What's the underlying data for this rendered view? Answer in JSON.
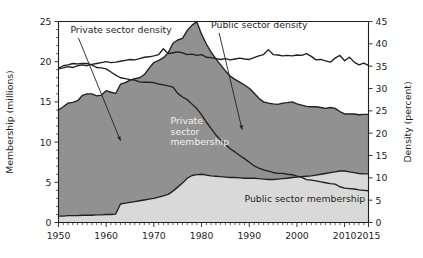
{
  "chart_data": {
    "type": "area",
    "title": "",
    "subtitle": "",
    "xlabel": "",
    "ylabel": "Membership (millions)",
    "y2label": "Density (percent)",
    "xlim": [
      1950,
      2015
    ],
    "ylim": [
      0,
      25
    ],
    "y2lim": [
      0,
      45
    ],
    "grid": false,
    "legend": "annotations-inline",
    "xticks": [
      1950,
      1960,
      1970,
      1980,
      1990,
      2000,
      2010,
      2015
    ],
    "xticklabels": [
      "1950",
      "1960",
      "1970",
      "1980",
      "1990",
      "2000",
      "2010",
      "2015"
    ],
    "yticks": [
      0,
      5,
      10,
      15,
      20,
      25
    ],
    "yticklabels": [
      "0",
      "5",
      "10",
      "15",
      "20",
      "25"
    ],
    "y2ticks": [
      0,
      5,
      10,
      15,
      20,
      25,
      30,
      35,
      40,
      45
    ],
    "y2ticklabels": [
      "0",
      "5",
      "10",
      "15",
      "20",
      "25",
      "30",
      "35",
      "40",
      "45"
    ],
    "annotations": [
      {
        "name": "private-sector-density-label",
        "text": "Private sector density",
        "x": 1952.5,
        "y": 23.6,
        "arrow_to_x": 1963.0,
        "arrow_to_y": 18.3
      },
      {
        "name": "public-sector-density-label",
        "text": "Public sector density",
        "x": 1982.0,
        "y": 24.2,
        "arrow_to_x": 1988.5,
        "arrow_to_y": 20.8
      },
      {
        "name": "private-sector-membership-label",
        "text": "Private\nsector\nmembership",
        "x": 1973.5,
        "y": 12.2
      },
      {
        "name": "public-sector-membership-label",
        "text": "Public sector membership",
        "x": 1989.0,
        "y": 2.6
      }
    ],
    "x": [
      1950,
      1951,
      1952,
      1953,
      1954,
      1955,
      1956,
      1957,
      1958,
      1959,
      1960,
      1961,
      1962,
      1963,
      1964,
      1965,
      1966,
      1967,
      1968,
      1969,
      1970,
      1971,
      1972,
      1973,
      1974,
      1975,
      1976,
      1977,
      1978,
      1979,
      1980,
      1981,
      1982,
      1983,
      1984,
      1985,
      1986,
      1987,
      1988,
      1989,
      1990,
      1991,
      1992,
      1993,
      1994,
      1995,
      1996,
      1997,
      1998,
      1999,
      2000,
      2001,
      2002,
      2003,
      2004,
      2005,
      2006,
      2007,
      2008,
      2009,
      2010,
      2011,
      2012,
      2013,
      2014,
      2015
    ],
    "series": [
      {
        "name": "Public sector membership",
        "axis": "left",
        "units": "millions",
        "style": "stacked-area-light",
        "color": "#d9d9d9",
        "values": [
          0.8,
          0.8,
          0.85,
          0.85,
          0.85,
          0.9,
          0.9,
          0.9,
          0.95,
          0.95,
          1.0,
          1.0,
          1.05,
          2.3,
          2.4,
          2.5,
          2.6,
          2.7,
          2.8,
          2.9,
          3.0,
          3.15,
          3.3,
          3.5,
          3.9,
          4.4,
          4.9,
          5.5,
          5.85,
          5.95,
          6.0,
          5.9,
          5.8,
          5.75,
          5.7,
          5.65,
          5.6,
          5.6,
          5.55,
          5.5,
          5.5,
          5.5,
          5.45,
          5.4,
          5.35,
          5.35,
          5.4,
          5.45,
          5.5,
          5.6,
          5.65,
          5.7,
          5.75,
          5.8,
          5.9,
          6.0,
          6.1,
          6.2,
          6.3,
          6.4,
          6.4,
          6.3,
          6.2,
          6.1,
          6.05,
          6.05
        ]
      },
      {
        "name": "Private sector membership",
        "axis": "left",
        "units": "millions",
        "style": "stacked-area-dark",
        "color": "#919191",
        "values": [
          13.2,
          13.6,
          14.0,
          14.1,
          14.3,
          14.9,
          15.1,
          15.1,
          14.8,
          14.9,
          15.4,
          15.2,
          15.0,
          14.9,
          15.0,
          15.2,
          15.3,
          15.3,
          15.6,
          16.3,
          16.9,
          17.0,
          17.2,
          17.6,
          18.4,
          18.3,
          18.0,
          18.4,
          18.7,
          19.0,
          17.4,
          16.3,
          15.4,
          14.6,
          13.9,
          13.2,
          12.6,
          12.2,
          11.9,
          11.6,
          11.2,
          10.6,
          10.0,
          9.6,
          9.5,
          9.4,
          9.3,
          9.4,
          9.4,
          9.4,
          9.1,
          8.9,
          8.7,
          8.6,
          8.5,
          8.3,
          8.1,
          8.1,
          7.9,
          7.4,
          7.1,
          7.2,
          7.3,
          7.3,
          7.4,
          7.4
        ]
      },
      {
        "name": "Private sector density",
        "axis": "right",
        "units": "percent",
        "style": "line",
        "color": "#231f20",
        "values": [
          34.5,
          35.1,
          35.3,
          35.6,
          35.5,
          35.6,
          35.6,
          35.3,
          34.7,
          34.6,
          34.4,
          33.7,
          33.0,
          32.4,
          32.2,
          32.0,
          31.9,
          31.5,
          31.4,
          31.4,
          31.3,
          31.0,
          30.8,
          30.6,
          30.3,
          28.9,
          28.1,
          27.5,
          26.5,
          25.5,
          24.1,
          22.5,
          21.0,
          19.6,
          18.5,
          17.5,
          16.5,
          15.8,
          15.0,
          14.3,
          13.5,
          12.7,
          12.2,
          11.8,
          11.5,
          11.2,
          11.0,
          11.0,
          10.8,
          10.7,
          10.4,
          10.1,
          9.6,
          9.5,
          9.3,
          9.1,
          8.9,
          8.7,
          8.6,
          8.0,
          7.7,
          7.6,
          7.5,
          7.3,
          7.2,
          7.1
        ]
      },
      {
        "name": "Public sector density",
        "axis": "right",
        "units": "percent",
        "style": "line",
        "color": "#231f20",
        "values": [
          34.4,
          34.6,
          34.9,
          34.7,
          35.1,
          35.3,
          35.1,
          35.4,
          35.6,
          35.8,
          36.0,
          35.8,
          35.9,
          36.1,
          36.3,
          36.5,
          36.4,
          36.7,
          37.0,
          37.1,
          37.3,
          37.6,
          38.9,
          37.8,
          38.0,
          38.2,
          38.0,
          37.6,
          37.7,
          37.4,
          37.6,
          37.0,
          36.9,
          36.7,
          36.5,
          36.7,
          36.4,
          36.6,
          36.8,
          36.6,
          36.5,
          36.9,
          37.3,
          37.6,
          38.7,
          37.6,
          37.5,
          37.3,
          37.4,
          37.3,
          37.5,
          37.4,
          37.8,
          37.2,
          36.4,
          36.5,
          36.2,
          35.9,
          36.8,
          37.4,
          36.2,
          37.0,
          35.9,
          35.3,
          35.7,
          35.2
        ]
      }
    ]
  },
  "colors": {
    "area_private": "#919191",
    "area_public": "#d9d9d9",
    "line": "#231f20",
    "background": "#ffffff"
  }
}
